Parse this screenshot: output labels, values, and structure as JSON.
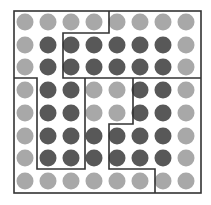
{
  "diagram": {
    "type": "dot-grid-partition",
    "rows": 8,
    "cols": 8,
    "colors": {
      "light": "#a8a8a8",
      "dark": "#585858",
      "line": "#333333",
      "background": "#ffffff"
    },
    "col_centers": [
      25,
      48,
      71,
      94,
      117,
      140,
      163,
      186
    ],
    "row_centers": [
      22,
      45,
      67,
      90,
      113,
      136,
      158,
      181
    ],
    "dot_radius": 8.5,
    "grid": [
      [
        "L",
        "L",
        "L",
        "L",
        "L",
        "L",
        "L",
        "L"
      ],
      [
        "L",
        "D",
        "D",
        "D",
        "D",
        "D",
        "D",
        "L"
      ],
      [
        "L",
        "D",
        "D",
        "D",
        "D",
        "D",
        "D",
        "L"
      ],
      [
        "L",
        "D",
        "D",
        "L",
        "L",
        "D",
        "D",
        "L"
      ],
      [
        "L",
        "D",
        "D",
        "L",
        "L",
        "D",
        "D",
        "L"
      ],
      [
        "L",
        "D",
        "D",
        "D",
        "D",
        "D",
        "D",
        "L"
      ],
      [
        "L",
        "D",
        "D",
        "D",
        "D",
        "D",
        "D",
        "L"
      ],
      [
        "L",
        "L",
        "L",
        "L",
        "L",
        "L",
        "L",
        "L"
      ]
    ],
    "outer_border": {
      "x1": 14,
      "y1": 11,
      "x2": 201,
      "y2": 193
    },
    "partition_paths": [
      {
        "name": "top-region-boundary",
        "points": [
          [
            109,
            11
          ],
          [
            109,
            33
          ],
          [
            63,
            33
          ],
          [
            63,
            78
          ],
          [
            201,
            78
          ]
        ]
      },
      {
        "name": "left-region-boundary",
        "points": [
          [
            14,
            78
          ],
          [
            37,
            78
          ],
          [
            37,
            169
          ],
          [
            85,
            169
          ],
          [
            85,
            78
          ]
        ]
      },
      {
        "name": "right-region-boundary",
        "points": [
          [
            133,
            78
          ],
          [
            133,
            124
          ],
          [
            109,
            124
          ],
          [
            109,
            169
          ],
          [
            155,
            169
          ],
          [
            155,
            193
          ]
        ]
      }
    ]
  }
}
